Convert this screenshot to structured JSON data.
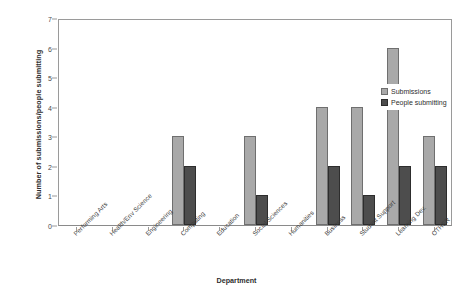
{
  "chart_data": {
    "type": "bar",
    "title": "",
    "xlabel": "Department",
    "ylabel": "Number of submissions/people submitting",
    "ylim": [
      0,
      7
    ],
    "yticks": [
      0,
      1,
      2,
      3,
      4,
      5,
      6,
      7
    ],
    "grid": false,
    "legend_position": "inside-right",
    "categories": [
      "Performing Arts",
      "Health/Env Science",
      "Engineering",
      "Computing",
      "Education",
      "Social Sciences",
      "Humanities",
      "Business",
      "Student Support",
      "Learning Dev.",
      "OTHER"
    ],
    "series": [
      {
        "name": "Submissions",
        "color": "#a9a9a9",
        "values": [
          0,
          0,
          0,
          3,
          0,
          3,
          0,
          4,
          4,
          6,
          3
        ]
      },
      {
        "name": "People submitting",
        "color": "#4d4d4d",
        "values": [
          0,
          0,
          0,
          2,
          0,
          1,
          0,
          2,
          1,
          2,
          2
        ]
      }
    ]
  },
  "legend": {
    "items": [
      {
        "label": "Submissions"
      },
      {
        "label": "People submitting"
      }
    ]
  }
}
